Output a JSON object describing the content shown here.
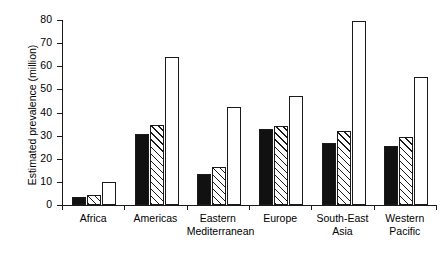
{
  "chart_data": {
    "type": "bar",
    "title": "",
    "xlabel": "",
    "ylabel": "Estimated prevalence (million)",
    "ylim": [
      0,
      80
    ],
    "yticks": [
      0,
      10,
      20,
      30,
      40,
      50,
      60,
      70,
      80
    ],
    "ytick_labels": [
      "0",
      "10",
      "20",
      "30",
      "40",
      "50",
      "60",
      "70",
      "80"
    ],
    "grid": false,
    "legend": "none",
    "categories": [
      "Africa",
      "Americas",
      "Eastern Mediterranean",
      "Europe",
      "South-East Asia",
      "Western Pacific"
    ],
    "category_lines": [
      [
        "Africa",
        ""
      ],
      [
        "Americas",
        ""
      ],
      [
        "Eastern",
        "Mediterranean"
      ],
      [
        "Europe",
        ""
      ],
      [
        "South-East",
        "Asia"
      ],
      [
        "Western",
        "Pacific"
      ]
    ],
    "series": [
      {
        "name": "series-1",
        "style": "solid-black",
        "values": [
          3.5,
          30.5,
          13.5,
          33.0,
          27.0,
          25.5
        ]
      },
      {
        "name": "series-2",
        "style": "diagonal-hatch",
        "values": [
          4.5,
          34.5,
          16.5,
          34.0,
          32.0,
          29.5
        ]
      },
      {
        "name": "series-3",
        "style": "open-white",
        "values": [
          10.0,
          64.0,
          42.5,
          47.0,
          79.5,
          55.5
        ]
      }
    ]
  },
  "colors": {
    "axis": "#1a1a1a",
    "solid_fill": "#111111",
    "open_fill": "#ffffff",
    "hatch_line": "#1a1a1a",
    "background": "#ffffff"
  }
}
